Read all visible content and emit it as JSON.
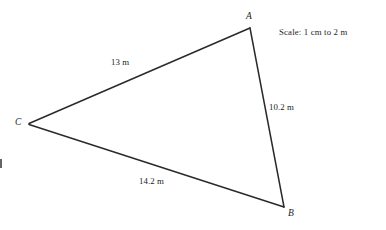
{
  "figure": {
    "type": "scale-drawing-triangle",
    "background_color": "#ffffff",
    "stroke_color": "#2a2a2a",
    "text_color": "#1d1d1d"
  },
  "vertices": [
    {
      "id": "A",
      "label": "A",
      "x": 250,
      "y": 28
    },
    {
      "id": "B",
      "label": "B",
      "x": 284,
      "y": 207
    },
    {
      "id": "C",
      "label": "C",
      "x": 29,
      "y": 124
    }
  ],
  "sides": [
    {
      "id": "CA",
      "from": "C",
      "to": "A",
      "label": "13 m",
      "length_value": 13,
      "unit": "m"
    },
    {
      "id": "AB",
      "from": "A",
      "to": "B",
      "label": "10.2 m",
      "length_value": 10.2,
      "unit": "m"
    },
    {
      "id": "CB",
      "from": "C",
      "to": "B",
      "label": "14.2 m",
      "length_value": 14.2,
      "unit": "m"
    }
  ],
  "annotations": {
    "scale_note": "Scale: 1 cm to 2 m",
    "scale_cm": 1,
    "scale_m": 2
  },
  "marks": {
    "left_edge_tick": ""
  }
}
